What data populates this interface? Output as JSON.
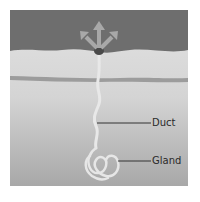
{
  "diagram": {
    "labels": {
      "duct": "Duct",
      "gland": "Gland"
    },
    "icons": {
      "arrows": "outward-arrows-icon"
    },
    "colors": {
      "upper_region": "#6e6e6e",
      "skin_top": "#dcdcdc",
      "skin_bottom": "#a9a9a9",
      "band": "#9a9a9a",
      "duct": "#e6e6e6",
      "pore": "#4a4a4a",
      "arrow": "#a8a8a8",
      "leader_line": "#333333"
    }
  }
}
